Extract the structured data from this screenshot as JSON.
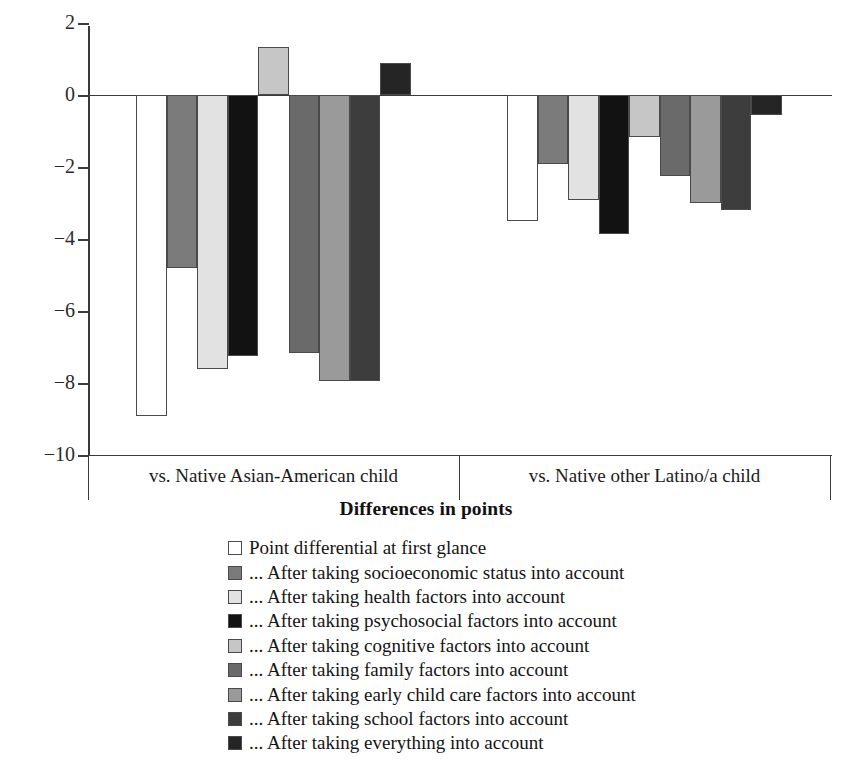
{
  "chart_data": {
    "type": "bar",
    "title": "",
    "xlabel": "Differences in points",
    "ylabel": "",
    "ylim": [
      -10,
      2
    ],
    "yticks": [
      2,
      0,
      -2,
      -4,
      -6,
      -8,
      -10
    ],
    "ytick_labels": [
      "2",
      "0",
      "−2",
      "−4",
      "−6",
      "−8",
      "−10"
    ],
    "grid": false,
    "legend_position": "bottom",
    "categories": [
      "vs. Native Asian-American child",
      "vs. Native other Latino/a child"
    ],
    "series": [
      {
        "name": "Point differential at first glance",
        "color": "#ffffff",
        "values": [
          -8.9,
          -3.5
        ]
      },
      {
        "name": "... After taking socioeconomic status into account",
        "color": "#7b7b7b",
        "values": [
          -4.8,
          -1.9
        ]
      },
      {
        "name": "... After taking health factors into account",
        "color": "#e2e2e2",
        "values": [
          -7.6,
          -2.9
        ]
      },
      {
        "name": "... After taking psychosocial factors into account",
        "color": "#121212",
        "values": [
          -7.25,
          -3.85
        ]
      },
      {
        "name": "... After taking cognitive factors into account",
        "color": "#c6c6c6",
        "values": [
          1.35,
          -1.15
        ]
      },
      {
        "name": "... After taking family factors into account",
        "color": "#6a6a6a",
        "values": [
          -7.15,
          -2.25
        ]
      },
      {
        "name": "... After taking early child care factors into account",
        "color": "#9a9a9a",
        "values": [
          -7.95,
          -3.0
        ]
      },
      {
        "name": "... After taking school factors into account",
        "color": "#3d3d3d",
        "values": [
          -7.95,
          -3.2
        ]
      },
      {
        "name": "... After taking everything into account",
        "color": "#252525",
        "values": [
          0.9,
          -0.55
        ]
      }
    ]
  },
  "axis": {
    "title": "Differences in points",
    "ytick_labels": [
      "2",
      "0",
      "−2",
      "−4",
      "−6",
      "−8",
      "−10"
    ],
    "category_labels": [
      "vs. Native Asian-American child",
      "vs. Native other Latino/a child"
    ]
  },
  "legend": {
    "items": [
      "Point differential at first glance",
      "... After taking socioeconomic status into account",
      "... After taking health factors into account",
      "... After taking psychosocial factors into account",
      "... After taking cognitive factors into account",
      "... After taking family factors into account",
      "... After taking early child care factors into account",
      "... After taking school factors into account",
      "... After taking everything into account"
    ]
  }
}
